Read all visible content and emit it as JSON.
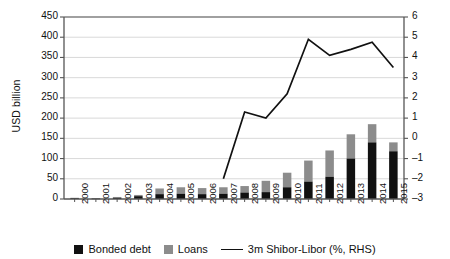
{
  "chart_data": {
    "type": "bar",
    "subtype": "stacked-bar-with-line-overlay",
    "title": "",
    "xlabel": "",
    "ylabel": "USD billion",
    "y2label": "",
    "categories": [
      "2000",
      "2001",
      "2002",
      "2003",
      "2004",
      "2005",
      "2006",
      "2007",
      "2008",
      "2009",
      "2010",
      "2011",
      "2012",
      "2013",
      "2014",
      "2015"
    ],
    "ylim": [
      0,
      450
    ],
    "yticks": [
      0,
      50,
      100,
      150,
      200,
      250,
      300,
      350,
      400,
      450
    ],
    "y2lim": [
      -3,
      6
    ],
    "y2ticks": [
      -3,
      -2,
      -1,
      0,
      1,
      2,
      3,
      4,
      5,
      6
    ],
    "grid": true,
    "legend_position": "bottom",
    "series": [
      {
        "name": "Bonded debt",
        "type": "bar",
        "axis": "left",
        "color": "#111111",
        "values": [
          2,
          1,
          3,
          7,
          12,
          13,
          12,
          13,
          16,
          17,
          29,
          43,
          55,
          100,
          140,
          118
        ]
      },
      {
        "name": "Loans",
        "type": "bar",
        "axis": "left",
        "color": "#8c8c8c",
        "values": [
          1,
          1,
          2,
          3,
          14,
          16,
          15,
          16,
          16,
          28,
          36,
          52,
          65,
          60,
          45,
          22
        ]
      },
      {
        "name": "3m Shibor-Libor (%, RHS)",
        "type": "line",
        "axis": "right",
        "color": "#111111",
        "x": [
          "2007",
          "2008",
          "2009",
          "2010",
          "2011",
          "2012",
          "2013",
          "2014",
          "2015"
        ],
        "values": [
          -2.0,
          1.3,
          1.0,
          2.2,
          4.9,
          4.1,
          4.4,
          4.75,
          3.5
        ]
      }
    ],
    "stack_totals": [
      3,
      2,
      5,
      10,
      26,
      29,
      27,
      29,
      32,
      45,
      65,
      95,
      120,
      160,
      185,
      140
    ],
    "stack_totals_note": "left-axis stacked totals (Bonded debt + Loans)"
  },
  "legend": {
    "items": [
      {
        "label": "Bonded debt",
        "marker": "square",
        "color": "#111111"
      },
      {
        "label": "Loans",
        "marker": "square",
        "color": "#8c8c8c"
      },
      {
        "label": "3m Shibor-Libor (%, RHS)",
        "marker": "line",
        "color": "#111111"
      }
    ]
  }
}
